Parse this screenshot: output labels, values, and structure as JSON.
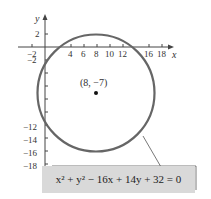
{
  "diagram": {
    "type": "circle-graph",
    "axes": {
      "x_label": "x",
      "y_label": "y",
      "x_ticks": [
        "−2",
        "4",
        "6",
        "8",
        "10",
        "12",
        "16",
        "18"
      ],
      "y_ticks_positive": [
        "2"
      ],
      "y_ticks_negative": [
        "−2",
        "−12",
        "−14",
        "−16",
        "−18"
      ]
    },
    "center": {
      "label": "(8, −7)",
      "x": 8,
      "y": -7
    },
    "radius": 9,
    "equation": {
      "text": "x² + y² − 16x + 14y + 32 = 0"
    },
    "colors": {
      "circle": "#666666",
      "axes": "#444444",
      "equation_box": "#d9d9d9"
    }
  }
}
